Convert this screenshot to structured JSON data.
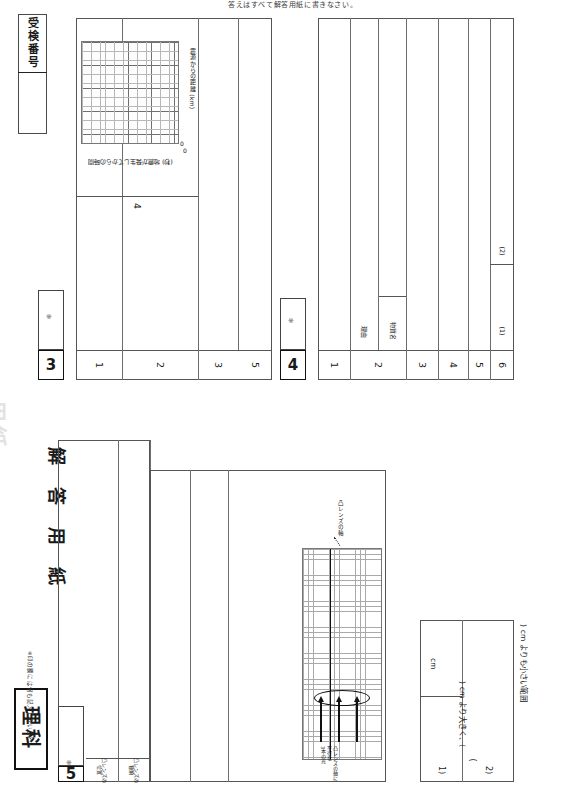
{
  "sheet": {
    "subject": "理科",
    "title": "解 答 用 紙",
    "caution": "※印の欄には何も記入しないこと。",
    "top_note": "答えはすべて解答用紙に書きなさい。",
    "exam_number_label": "受検番号",
    "score_mark": "※",
    "ghost_watermark": "用紙"
  },
  "question3": {
    "number": "3",
    "score_mark": "※",
    "rows": [
      {
        "no": "1"
      },
      {
        "no": "2"
      },
      {
        "no": "3"
      },
      {
        "no": "4"
      },
      {
        "no": "5"
      }
    ],
    "graph": {
      "y_axis_label": "震源からの距離 (km)",
      "x_axis_label": "地震が発生してからの時間",
      "x_axis_unit": "(秒)",
      "origin_label": "0",
      "origin_label2": "0"
    }
  },
  "question4": {
    "number": "4",
    "score_mark": "※",
    "rows": [
      {
        "no": "1"
      },
      {
        "no": "2",
        "sublabels": [
          "理由",
          "物質名"
        ]
      },
      {
        "no": "3"
      },
      {
        "no": "4"
      },
      {
        "no": "5"
      },
      {
        "no": "6",
        "sublabels": [
          "(1)",
          "(2)"
        ]
      }
    ]
  },
  "question5": {
    "number": "5",
    "score_mark": "※",
    "rows": [
      {
        "no": "1",
        "sublabels": [
          "凸レンズの\\n位置",
          "凸レンズの\\n種類"
        ]
      },
      {
        "no": "2"
      },
      {
        "no": "3"
      },
      {
        "no": "4"
      }
    ],
    "figure": {
      "axis_label": "凸レンズの軸",
      "rays_label": "凸レンズの軸に平行な\\n3本の光"
    },
    "answer_strip": {
      "unit": "cm",
      "range_text_1": "(",
      "range_text_2": ") cm より大きく、(",
      "range_text_3": ") cm よりも小さい範囲",
      "paren_open": "(",
      "paren_close": ")",
      "row1_tag": "1)",
      "row2_tag": "2)"
    }
  }
}
